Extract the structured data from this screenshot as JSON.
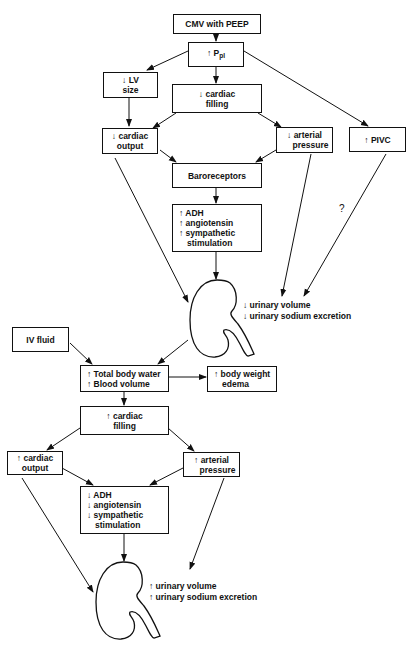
{
  "diagram": {
    "top": {
      "cmv": "CMV with PEEP",
      "ppl": {
        "arrow": "↑",
        "label": "P",
        "sub": "pl"
      },
      "lv_size": [
        "↓ LV",
        "size"
      ],
      "cardiac_filling": [
        "↓ cardiac",
        "filling"
      ],
      "cardiac_output": [
        "↓ cardiac",
        "output"
      ],
      "arterial_pressure": [
        "↓ arterial",
        "pressure"
      ],
      "pivc": "↑ PIVC",
      "baroreceptors": "Baroreceptors",
      "hormones": [
        "↑ ADH",
        "↑ angiotensin",
        "↑ sympathetic",
        "stimulation"
      ],
      "question_mark": "?",
      "kidney_effects": [
        "↓ urinary volume",
        "↓ urinary sodium excretion"
      ]
    },
    "bottom": {
      "iv_fluid": "IV fluid",
      "body_water": [
        "↑ Total body water",
        "↑ Blood volume"
      ],
      "body_weight": [
        "↑ body weight",
        "edema"
      ],
      "cardiac_filling": [
        "↑ cardiac",
        "filling"
      ],
      "cardiac_output": [
        "↑ cardiac",
        "output"
      ],
      "arterial_pressure": [
        "↑ arterial",
        "pressure"
      ],
      "hormones": [
        "↓ ADH",
        "↓ angiotensin",
        "↓ sympathetic",
        "stimulation"
      ],
      "kidney_effects": [
        "↑ urinary volume",
        "↑ urinary sodium excretion"
      ]
    },
    "colors": {
      "ink": "#111111",
      "background": "#ffffff"
    }
  }
}
